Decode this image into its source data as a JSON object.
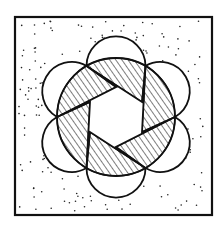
{
  "diagram": {
    "title": "",
    "frame": {
      "x": 15,
      "y": 17,
      "width": 197,
      "height": 198,
      "stroke": "#111111"
    },
    "circle": {
      "cx": 116,
      "cy": 117,
      "r": 59
    },
    "star": {
      "outer_r": 59,
      "inner_r": 30,
      "points": 6
    },
    "petals": {
      "count": 6,
      "shape": "semicircle"
    },
    "fills": {
      "background": "stipple",
      "segments": "diagonal-hatch",
      "star": "white"
    },
    "colors": {
      "ink": "#111111",
      "paper": "#ffffff"
    }
  }
}
